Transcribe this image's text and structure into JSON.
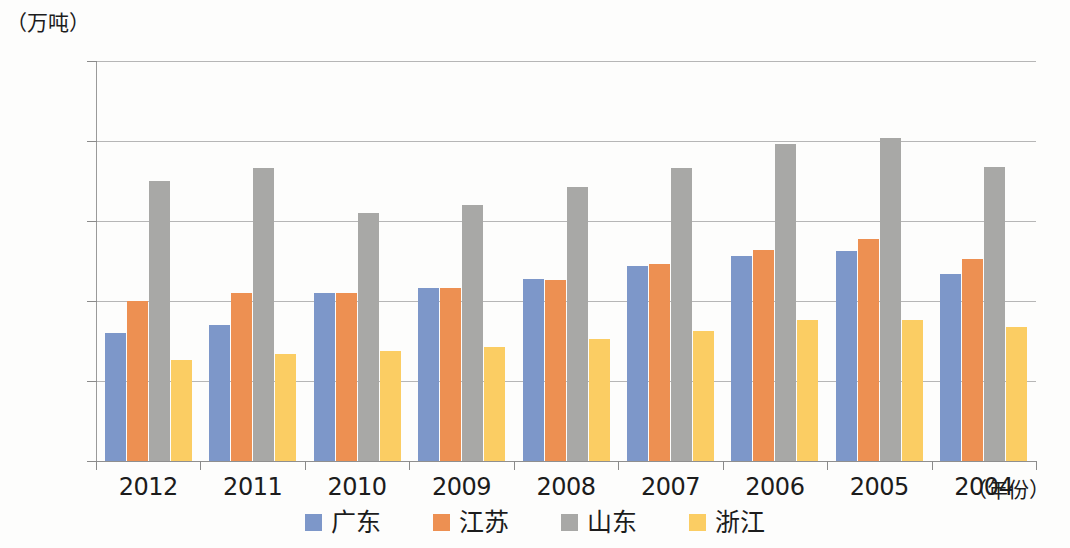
{
  "axes": {
    "y_unit_caption": "（万吨）",
    "x_caption": "（年份）",
    "y_ticks": [
      250,
      200,
      150,
      100,
      50,
      0
    ],
    "y_min": 0,
    "y_max": 250
  },
  "legend": {
    "items": [
      {
        "label": "广东",
        "color": "#7d97c9"
      },
      {
        "label": "江苏",
        "color": "#ed9052"
      },
      {
        "label": "山东",
        "color": "#a8a8a6"
      },
      {
        "label": "浙江",
        "color": "#fbcd63"
      }
    ]
  },
  "chart_data": {
    "type": "bar",
    "title": "",
    "xlabel": "（年份）",
    "ylabel": "（万吨）",
    "ylim": [
      0,
      250
    ],
    "yticks": [
      0,
      50,
      100,
      150,
      200,
      250
    ],
    "grid": true,
    "legend_position": "bottom",
    "categories": [
      "2012",
      "2011",
      "2010",
      "2009",
      "2008",
      "2007",
      "2006",
      "2005",
      "2004"
    ],
    "series": [
      {
        "name": "广东",
        "color": "#7d97c9",
        "values": [
          80,
          85,
          105,
          108,
          114,
          122,
          128,
          131,
          117
        ]
      },
      {
        "name": "江苏",
        "color": "#ed9052",
        "values": [
          100,
          105,
          105,
          108,
          113,
          123,
          132,
          139,
          126
        ]
      },
      {
        "name": "山东",
        "color": "#a8a8a6",
        "values": [
          175,
          183,
          155,
          160,
          171,
          183,
          198,
          202,
          184
        ]
      },
      {
        "name": "浙江",
        "color": "#fbcd63",
        "values": [
          63,
          67,
          69,
          71,
          76,
          81,
          88,
          88,
          84
        ]
      }
    ]
  }
}
